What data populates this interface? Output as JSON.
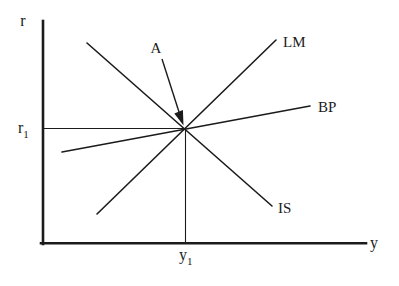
{
  "diagram": {
    "colors": {
      "ink": "#1b1b1b",
      "background": "#ffffff"
    },
    "axes": {
      "vertical_label": "r",
      "horizontal_label": "y"
    },
    "curves": {
      "lm": "LM",
      "bp": "BP",
      "is": "IS"
    },
    "annotation": {
      "point_label": "A"
    },
    "references": {
      "rate": {
        "base": "r",
        "sub": "1"
      },
      "output": {
        "base": "y",
        "sub": "1"
      }
    }
  }
}
